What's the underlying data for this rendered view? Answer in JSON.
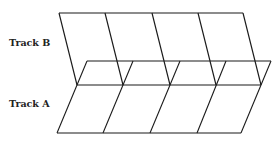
{
  "labels": {
    "track_b": "Track B",
    "track_a": "Track A"
  },
  "colors": {
    "line": "#1a1a1a",
    "text": "#222222",
    "background": "#ffffff"
  },
  "tracks": {
    "track_b": {
      "segments": 4,
      "top_y": 13,
      "bottom_y": 85,
      "top_x": [
        59,
        105,
        152,
        198,
        243
      ],
      "bottom_x": [
        77,
        123,
        170,
        216,
        261
      ]
    },
    "track_a": {
      "segments": 4,
      "top_y": 61,
      "bottom_y": 133,
      "top_x": [
        87,
        133,
        180,
        226,
        271
      ],
      "bottom_x": [
        57,
        103,
        150,
        197,
        241
      ]
    }
  }
}
